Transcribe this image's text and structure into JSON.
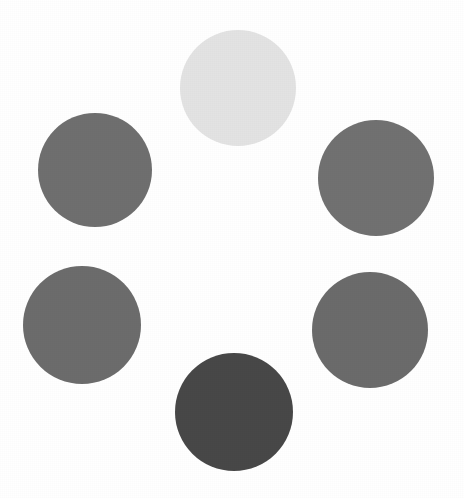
{
  "figure": {
    "background_color": "#ffffff",
    "width": 464,
    "height": 498
  },
  "chart_data": {
    "type": "scatter",
    "title": "",
    "xlabel": "",
    "ylabel": "",
    "xlim": [
      0,
      464
    ],
    "ylim": [
      0,
      498
    ],
    "grid": false,
    "legend": null,
    "marker": "circle",
    "background_color": "#ffffff",
    "points": [
      {
        "name": "top-center-circle",
        "label": "lightest",
        "cx": 238,
        "cy": 88,
        "diameter": 116,
        "radius": 58,
        "color": "#e3e3e3",
        "gray_level": 227,
        "rank_by_lightness": 1
      },
      {
        "name": "top-left-circle",
        "label": "mid-gray",
        "cx": 95,
        "cy": 170,
        "diameter": 114,
        "radius": 57,
        "color": "#6f6f6f",
        "gray_level": 111,
        "rank_by_lightness": 3
      },
      {
        "name": "top-right-circle",
        "label": "mid-gray",
        "cx": 376,
        "cy": 178,
        "diameter": 116,
        "radius": 58,
        "color": "#717171",
        "gray_level": 113,
        "rank_by_lightness": 2
      },
      {
        "name": "bottom-left-circle",
        "label": "mid-gray",
        "cx": 82,
        "cy": 325,
        "diameter": 118,
        "radius": 59,
        "color": "#6c6c6c",
        "gray_level": 108,
        "rank_by_lightness": 4
      },
      {
        "name": "bottom-right-circle",
        "label": "mid-gray",
        "cx": 370,
        "cy": 330,
        "diameter": 116,
        "radius": 58,
        "color": "#6b6b6b",
        "gray_level": 107,
        "rank_by_lightness": 5
      },
      {
        "name": "bottom-center-circle",
        "label": "darkest",
        "cx": 234,
        "cy": 412,
        "diameter": 118,
        "radius": 59,
        "color": "#484848",
        "gray_level": 72,
        "rank_by_lightness": 6
      }
    ]
  }
}
